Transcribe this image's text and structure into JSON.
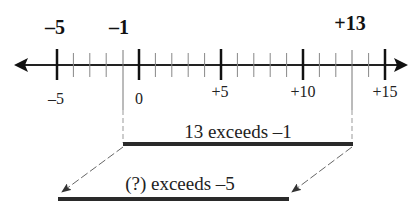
{
  "title_labels": {
    "minus5": "–5",
    "minus1": "–1",
    "plus13": "+13"
  },
  "number_line": {
    "min": -6,
    "max": 15,
    "major_ticks": [
      -5,
      0,
      5,
      10,
      15
    ],
    "minor_step": 1,
    "tick_labels": [
      "–5",
      "0",
      "+5",
      "+10",
      "+15"
    ],
    "arrow_left": true,
    "arrow_right": true
  },
  "bars": {
    "top": {
      "label": "13 exceeds –1",
      "from": -1,
      "to": 13
    },
    "bottom": {
      "label": "(?) exceeds –5",
      "from": -5,
      "to": 9
    }
  },
  "colors": {
    "ink": "#111111",
    "light_ink": "#777777",
    "bar": "#2a2a2a"
  }
}
